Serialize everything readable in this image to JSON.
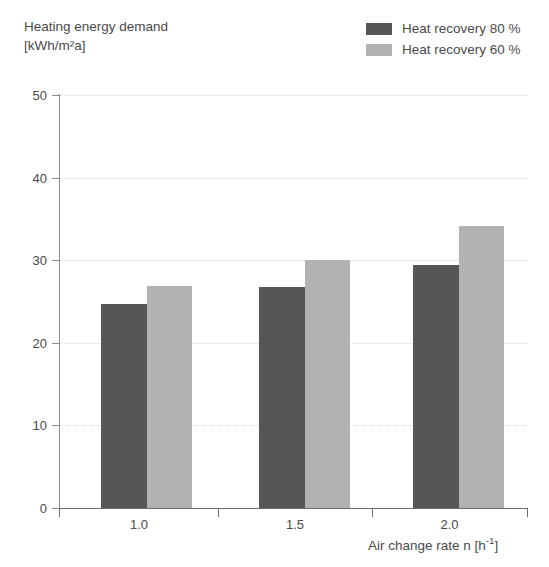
{
  "chart_data": {
    "type": "bar",
    "title": "Heating energy demand",
    "title_line1": "Heating energy demand",
    "title_line2": "[kWh/m²a]",
    "ylabel": "Heating energy demand [kWh/m²a]",
    "xlabel": "Air change rate n [h⁻¹]",
    "categories": [
      "1.0",
      "1.5",
      "2.0"
    ],
    "series": [
      {
        "name": "Heat recovery 80 %",
        "color": "#555658",
        "values": [
          24.7,
          26.7,
          29.4
        ]
      },
      {
        "name": "Heat recovery 60 %",
        "color": "#b1b2b3",
        "values": [
          26.9,
          30.0,
          34.2
        ]
      }
    ],
    "ylim": [
      0,
      50
    ],
    "yticks": [
      "0",
      "10",
      "20",
      "30",
      "40",
      "50"
    ],
    "ytick_values": [
      0,
      10,
      20,
      30,
      40,
      50
    ],
    "grid": true,
    "grid_axis": "y",
    "legend_position": "top-right"
  },
  "header": {
    "title_line1": "Heating energy demand",
    "title_line2": "[kWh/m²a]"
  },
  "legend": {
    "items": [
      {
        "label": "Heat recovery 80 %",
        "color": "#555658"
      },
      {
        "label": "Heat recovery 60 %",
        "color": "#b1b2b3"
      }
    ]
  },
  "axes": {
    "x": {
      "title_text": "Air change rate n",
      "title_unit_open": " [h",
      "title_unit_exp": "-1",
      "title_unit_close": "]",
      "ticks": [
        "1.0",
        "1.5",
        "2.0"
      ]
    },
    "y": {
      "ticks": [
        "50",
        "40",
        "30",
        "20",
        "10",
        "0"
      ]
    }
  }
}
